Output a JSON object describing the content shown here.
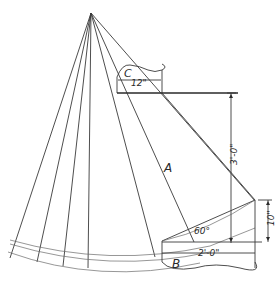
{
  "drawing": {
    "type": "sheet-metal development (transition between two cylindrical pipes)",
    "labels": {
      "pipe_top": "C",
      "pipe_bottom": "B",
      "transition": "A"
    },
    "dimensions": {
      "top_diameter": "12\"",
      "bottom_diameter": "2'-0\"",
      "height": "3'-0\"",
      "bottom_rise": "10\"",
      "angle": "60°"
    },
    "colors": {
      "line": "#3a3a3a",
      "background": "#ffffff"
    }
  }
}
